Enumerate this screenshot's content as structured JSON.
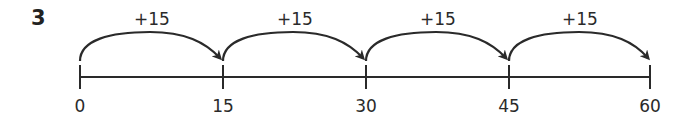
{
  "question": {
    "number": "3"
  },
  "number_line": {
    "start": 0,
    "end": 60,
    "step": 15,
    "ticks": [
      {
        "value": 0,
        "label": "0"
      },
      {
        "value": 15,
        "label": "15"
      },
      {
        "value": 30,
        "label": "30"
      },
      {
        "value": 45,
        "label": "45"
      },
      {
        "value": 60,
        "label": "60"
      }
    ],
    "jumps": [
      {
        "from": 0,
        "to": 15,
        "label": "+15"
      },
      {
        "from": 15,
        "to": 30,
        "label": "+15"
      },
      {
        "from": 30,
        "to": 45,
        "label": "+15"
      },
      {
        "from": 45,
        "to": 60,
        "label": "+15"
      }
    ],
    "colors": {
      "line": "#2a2a2a",
      "text": "#2a2a2a"
    }
  }
}
